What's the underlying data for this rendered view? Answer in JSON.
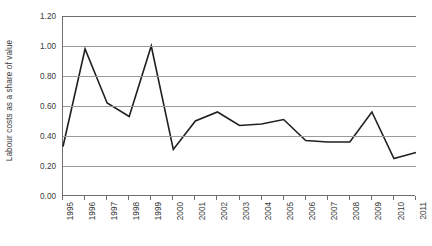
{
  "chart_data": {
    "type": "line",
    "title": "",
    "xlabel": "",
    "ylabel": "Labour costs as a share of value",
    "categories": [
      "1995",
      "1996",
      "1997",
      "1998",
      "1999",
      "2000",
      "2001",
      "2002",
      "2003",
      "2004",
      "2005",
      "2006",
      "2007",
      "2008",
      "2009",
      "2010",
      "2011"
    ],
    "values": [
      0.33,
      0.98,
      0.62,
      0.53,
      1.0,
      0.31,
      0.5,
      0.56,
      0.47,
      0.48,
      0.51,
      0.37,
      0.36,
      0.36,
      0.56,
      0.25,
      0.29
    ],
    "series": [
      {
        "name": "Labour costs as a share of value",
        "values": [
          0.33,
          0.98,
          0.62,
          0.53,
          1.0,
          0.31,
          0.5,
          0.56,
          0.47,
          0.48,
          0.51,
          0.37,
          0.36,
          0.36,
          0.56,
          0.25,
          0.29
        ]
      }
    ],
    "ylim": [
      0.0,
      1.2
    ],
    "ytick_values": [
      0.0,
      0.2,
      0.4,
      0.6,
      0.8,
      1.0,
      1.2
    ],
    "ytick_labels": [
      "0.00",
      "0.20",
      "0.40",
      "0.60",
      "0.80",
      "1.00",
      "1.20"
    ],
    "grid": true,
    "legend": false,
    "legend_position": "none",
    "line_color": "#231f20",
    "gridline_color": "#9a9a9a",
    "axis_color": "#6e6e6e",
    "background_color": "#ffffff",
    "xtick_label_rotation": 90
  }
}
